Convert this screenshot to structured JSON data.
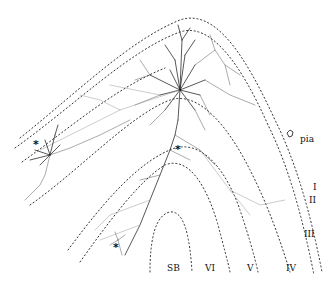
{
  "figure": {
    "type": "neuron-reconstruction-in-cortical-layers",
    "layer_labels": [
      {
        "id": "pia",
        "text": "pia"
      },
      {
        "id": "I",
        "text": "I"
      },
      {
        "id": "II",
        "text": "II"
      },
      {
        "id": "III",
        "text": "III"
      },
      {
        "id": "IV",
        "text": "IV"
      },
      {
        "id": "V",
        "text": "V"
      },
      {
        "id": "VI",
        "text": "VI"
      },
      {
        "id": "SB",
        "text": "SB"
      }
    ],
    "markers": [
      {
        "id": "soma-left",
        "text": "*"
      },
      {
        "id": "soma-middle",
        "text": "*"
      },
      {
        "id": "soma-bottom",
        "text": "*"
      }
    ],
    "colors": {
      "background": "#ffffff",
      "ink": "#111111",
      "boundary": "#333333",
      "axon": "#999999"
    }
  }
}
